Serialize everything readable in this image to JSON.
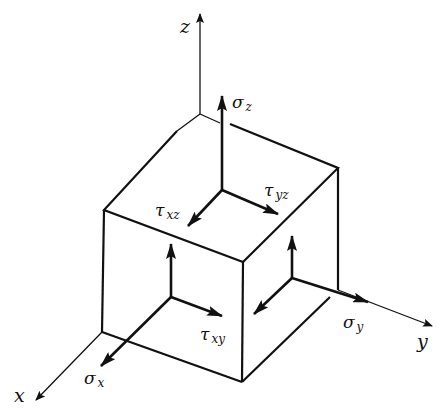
{
  "diagram": {
    "type": "3D stress element (cube) with stress components",
    "stroke_color": "#111111",
    "background": "#ffffff",
    "axes": {
      "x": {
        "label": "x"
      },
      "y": {
        "label": "y"
      },
      "z": {
        "label": "z"
      }
    },
    "normal_stresses": {
      "sigma_x": {
        "symbol": "σ",
        "sub": "x"
      },
      "sigma_y": {
        "symbol": "σ",
        "sub": "y"
      },
      "sigma_z": {
        "symbol": "σ",
        "sub": "z"
      }
    },
    "shear_stresses": {
      "tau_xy": {
        "symbol": "τ",
        "sub": "xy"
      },
      "tau_xz": {
        "symbol": "τ",
        "sub": "xz"
      },
      "tau_yz": {
        "symbol": "τ",
        "sub": "yz"
      }
    }
  }
}
